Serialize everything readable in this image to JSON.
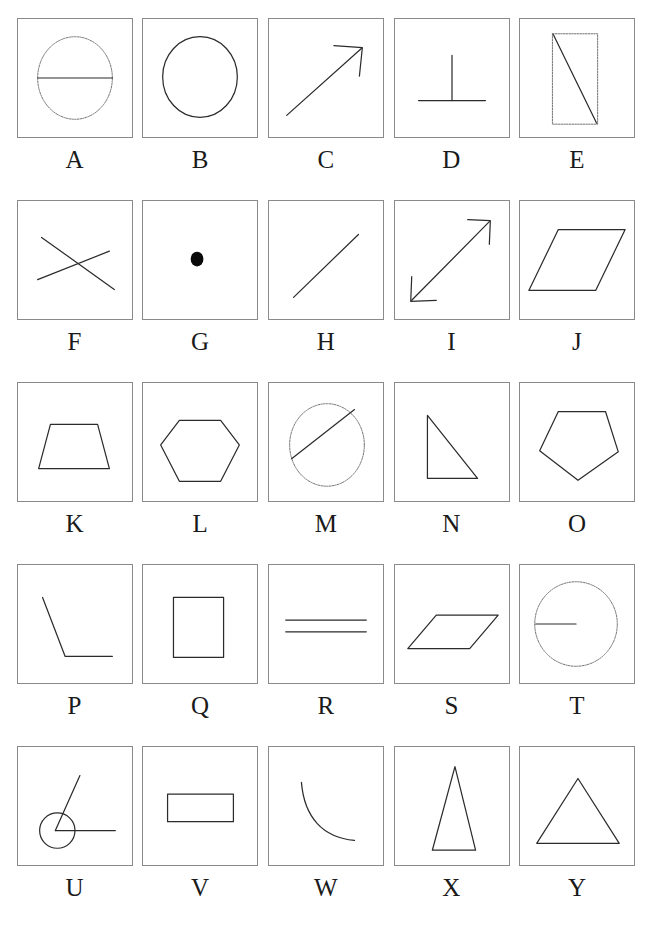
{
  "sheet": {
    "title": "Geometric shape reference chart",
    "columns": 5,
    "rows": 5,
    "background_color": "#ffffff",
    "panel_border_color": "#8a8a8a",
    "ink_color": "#2b2b2b",
    "label_color": "#1a1a1a"
  },
  "items": [
    {
      "label": "A",
      "shape": "circle-with-horizontal-diameter",
      "description": "Circle drawn with a dotted outline and a solid horizontal diameter line through its center"
    },
    {
      "label": "B",
      "shape": "circle",
      "description": "Plain circle outline, slightly taller than wide"
    },
    {
      "label": "C",
      "shape": "arrow-diagonal-up-right",
      "description": "Single-headed arrow pointing up and to the right"
    },
    {
      "label": "D",
      "shape": "perpendicular-symbol",
      "description": "Perpendicular mark: a vertical segment meeting a horizontal segment at its midpoint"
    },
    {
      "label": "E",
      "shape": "rectangle-with-diagonal",
      "description": "Tall dotted rectangle with a solid diagonal from top-left to bottom-right"
    },
    {
      "label": "F",
      "shape": "two-crossing-lines",
      "description": "Two straight lines crossing in an X near the middle"
    },
    {
      "label": "G",
      "shape": "filled-dot",
      "description": "Single small solid black dot at the center"
    },
    {
      "label": "H",
      "shape": "diagonal-line",
      "description": "Single straight diagonal line rising to the right"
    },
    {
      "label": "I",
      "shape": "double-headed-arrow-diagonal",
      "description": "Diagonal line with open square arrowheads at both ends"
    },
    {
      "label": "J",
      "shape": "parallelogram-tall",
      "description": "Large parallelogram slanting to the right"
    },
    {
      "label": "K",
      "shape": "trapezoid",
      "description": "Isosceles trapezoid with the longer side at the bottom"
    },
    {
      "label": "L",
      "shape": "hexagon",
      "description": "Regular hexagon with flat top and bottom edges"
    },
    {
      "label": "M",
      "shape": "circle-with-chord",
      "description": "Dotted circle crossed by a solid chord from the left side to the upper right"
    },
    {
      "label": "N",
      "shape": "right-triangle",
      "description": "Right triangle with a vertical left leg and horizontal bottom leg"
    },
    {
      "label": "O",
      "shape": "pentagon-inverted",
      "description": "Pentagon with a flat top edge and a vertex pointing down"
    },
    {
      "label": "P",
      "shape": "angle-obtuse",
      "description": "Bent line: a steep segment descending to a vertex then a horizontal segment to the right"
    },
    {
      "label": "Q",
      "shape": "rectangle-vertical",
      "description": "Upright rectangle, taller than wide"
    },
    {
      "label": "R",
      "shape": "two-parallel-lines",
      "description": "Two short horizontal parallel line segments, one above the other"
    },
    {
      "label": "S",
      "shape": "parallelogram-flat",
      "description": "Wide flat parallelogram slanting to the right"
    },
    {
      "label": "T",
      "shape": "circle-with-radius",
      "description": "Dotted circle with a solid horizontal radius from the left edge to the center"
    },
    {
      "label": "U",
      "shape": "angle-with-arc-circle",
      "description": "Angle formed by a slanted ray and a horizontal ray, with a circle marking the vertex"
    },
    {
      "label": "V",
      "shape": "rectangle-horizontal",
      "description": "Wide rectangle, wider than tall"
    },
    {
      "label": "W",
      "shape": "concave-curve",
      "description": "Single smooth curve bending from upper left down to lower right"
    },
    {
      "label": "X",
      "shape": "triangle-narrow",
      "description": "Tall narrow isosceles triangle"
    },
    {
      "label": "Y",
      "shape": "triangle-equilateral",
      "description": "Broad equilateral triangle with a flat base"
    }
  ]
}
